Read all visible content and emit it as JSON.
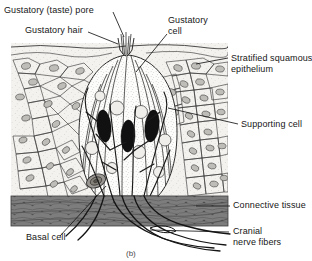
{
  "figure": {
    "caption": "(b)"
  },
  "labels": {
    "gustatory_pore": "Gustatory (taste) pore",
    "gustatory_hair": "Gustatory hair",
    "gustatory_cell_line1": "Gustatory",
    "gustatory_cell_line2": "cell",
    "stratified_epithelium_line1": "Stratified squamous",
    "stratified_epithelium_line2": "epithelium",
    "supporting_cell": "Supporting cell",
    "connective_tissue": "Connective tissue",
    "cranial_line1": "Cranial",
    "cranial_line2": "nerve fibers",
    "basal_cell": "Basal cell"
  },
  "colors": {
    "ink": "#161616",
    "epithelium_fill": "#f2f1ee",
    "tastebud_fill": "#fbfbf9",
    "gustatory_cell_fill": "#111111",
    "connective_tissue_fill": "#7b7b7b",
    "page_background": "#ffffff"
  },
  "structures": {
    "epithelium": "stratified squamous epithelium with polygonal cells and oval nuclei",
    "taste_bud": "onion-shaped taste bud containing dark gustatory cells and pale supporting cells",
    "gustatory_cells_count": 3,
    "connective_tissue": "dark fibrous band beneath epithelium",
    "nerve_fibers": "cranial nerve fibers branching from base of taste bud"
  }
}
